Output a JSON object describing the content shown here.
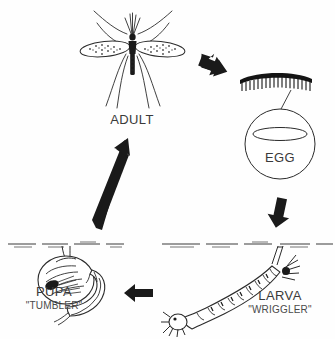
{
  "diagram": {
    "background_color": "#fefefe",
    "ink_color": "#2b2b2b",
    "text_color": "#3a3a3a"
  },
  "stages": [
    {
      "id": "adult",
      "label": "ADULT",
      "sublabel": "",
      "icon": "mosquito-adult-icon",
      "position": "top-center"
    },
    {
      "id": "egg",
      "label": "EGG",
      "sublabel": "",
      "icon": "egg-raft-icon",
      "position": "right"
    },
    {
      "id": "larva",
      "label": "LARVA",
      "sublabel": "\"WRIGGLER\"",
      "icon": "mosquito-larva-icon",
      "position": "bottom-right"
    },
    {
      "id": "pupa",
      "label": "PUPA",
      "sublabel": "\"TUMBLER\"",
      "icon": "mosquito-pupa-icon",
      "position": "bottom-left"
    }
  ],
  "arrows": [
    {
      "id": "adult-to-egg",
      "direction": "down-right",
      "from": "adult",
      "to": "egg"
    },
    {
      "id": "egg-to-larva",
      "direction": "down",
      "from": "egg",
      "to": "larva"
    },
    {
      "id": "larva-to-pupa",
      "direction": "left",
      "from": "larva",
      "to": "pupa"
    },
    {
      "id": "pupa-to-adult",
      "direction": "up-right",
      "from": "pupa",
      "to": "adult"
    }
  ]
}
